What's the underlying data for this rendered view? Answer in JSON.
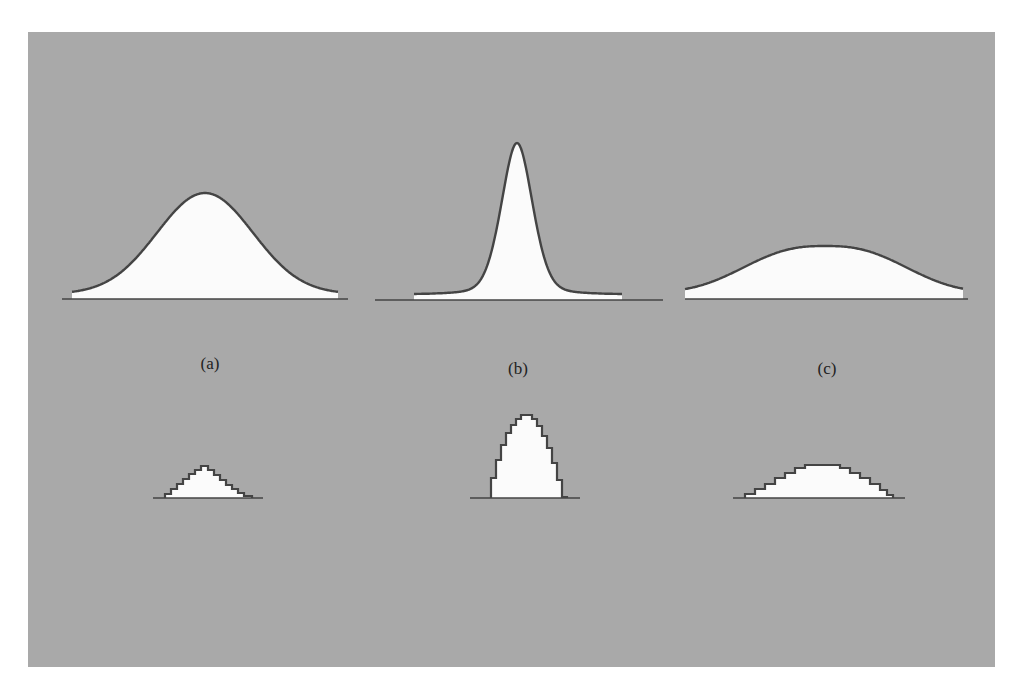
{
  "figure": {
    "background_color": "#a9a9a9",
    "fill_color": "#fbfbfb",
    "stroke_color": "#444444",
    "labels": [
      {
        "id": "a",
        "text": "(a)",
        "x": 210,
        "y": 364
      },
      {
        "id": "b",
        "text": "(b)",
        "x": 518,
        "y": 369
      },
      {
        "id": "c",
        "text": "(c)",
        "x": 827,
        "y": 369
      }
    ],
    "continuous_curves": [
      {
        "id": "a",
        "description": "medium-width bell curve",
        "center_x": 205,
        "peak_y": 193,
        "base_y": 294,
        "axis_y": 299,
        "axis_x": [
          62,
          348
        ],
        "curve_x": [
          72,
          338
        ],
        "sigma": 48
      },
      {
        "id": "b",
        "description": "narrow tall peaked curve",
        "center_x": 517,
        "peak_y": 143,
        "base_y": 295,
        "axis_y": 300,
        "axis_x": [
          375,
          663
        ],
        "curve_x": [
          414,
          622
        ],
        "sigma": 16
      },
      {
        "id": "c",
        "description": "wide flat bell curve",
        "center_x": 825,
        "peak_y": 246,
        "base_y": 293,
        "axis_y": 299,
        "axis_x": [
          685,
          968
        ],
        "curve_x": [
          685,
          963
        ],
        "sigma": 60
      }
    ],
    "discrete_histograms": [
      {
        "id": "a",
        "description": "stepwise discretized version of curve a",
        "axis_y": 498,
        "axis_x": [
          153,
          263
        ],
        "steps_x": [
          165,
          171,
          177,
          183,
          189,
          195,
          201,
          208,
          214,
          220,
          226,
          232,
          238,
          244,
          252
        ],
        "steps_y": [
          494,
          489,
          484,
          479,
          474,
          470,
          466,
          470,
          475,
          480,
          485,
          489,
          493,
          496
        ]
      },
      {
        "id": "b",
        "description": "stepwise discretized version of curve b",
        "axis_y": 498,
        "axis_x": [
          470,
          580
        ],
        "steps_x": [
          491,
          496,
          501,
          506,
          511,
          516,
          521,
          532,
          537,
          542,
          547,
          552,
          557,
          562,
          567
        ],
        "steps_y": [
          478,
          460,
          445,
          433,
          425,
          419,
          415,
          419,
          426,
          436,
          448,
          463,
          480,
          497
        ]
      },
      {
        "id": "c",
        "description": "stepwise discretized version of curve c",
        "axis_y": 498,
        "axis_x": [
          733,
          905
        ],
        "steps_x": [
          745,
          755,
          765,
          775,
          785,
          795,
          805,
          840,
          850,
          860,
          870,
          880,
          887,
          893
        ],
        "steps_y": [
          494,
          489,
          484,
          478,
          473,
          468,
          465,
          468,
          473,
          478,
          484,
          490,
          495
        ]
      }
    ]
  }
}
